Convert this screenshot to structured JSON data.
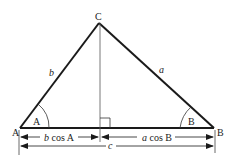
{
  "diagram": {
    "type": "triangle-law-of-cosines",
    "vertices": {
      "A": "A",
      "B": "B",
      "C": "C"
    },
    "sides": {
      "a": "a",
      "b": "b",
      "c": "c"
    },
    "angles": {
      "A": "A",
      "B": "B"
    },
    "dimensions": {
      "left_segment_var": "b",
      "left_segment_rest": " cos A",
      "right_segment_var": "a",
      "right_segment_rest": " cos B",
      "base": "c"
    },
    "colors": {
      "line": "#1a1a1a",
      "thin": "#444444",
      "background": "#ffffff"
    }
  }
}
